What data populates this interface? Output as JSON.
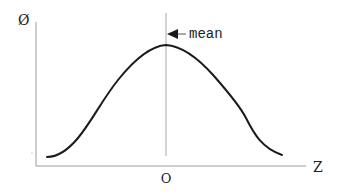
{
  "diagram": {
    "type": "bell-curve",
    "y_axis_label": "Ø",
    "x_axis_label": "Z",
    "center_tick_label": "O",
    "annotation": "mean",
    "colors": {
      "curve": "#1a1a1a",
      "axes": "#9a9a9a",
      "mean_line": "#a8a8a8",
      "text": "#222222"
    }
  }
}
